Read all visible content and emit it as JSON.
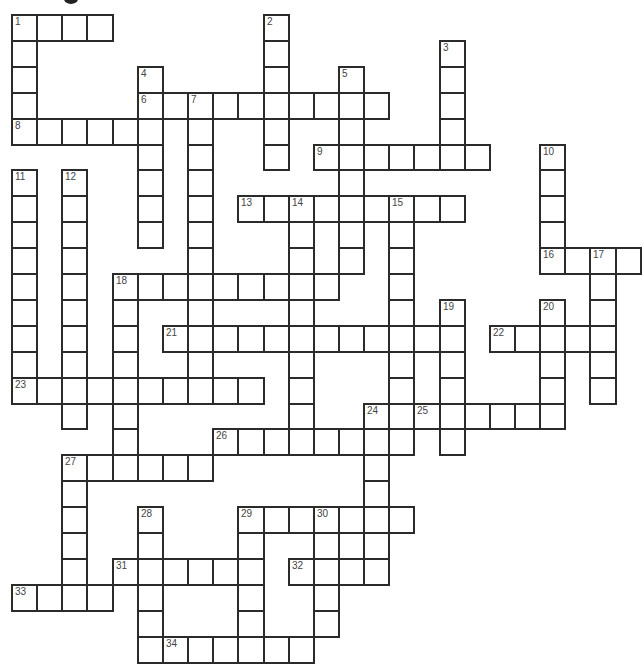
{
  "puzzle": {
    "type": "crossword",
    "title_fragment_visible": true,
    "grid": {
      "origin_x": 12,
      "origin_y": 15,
      "cell_width": 25.15,
      "cell_height": 25.9,
      "border_color": "#2b2b2b",
      "fill_color": "#ffffff",
      "number_color": "#444444"
    },
    "across": [
      {
        "num": "1",
        "row": 0,
        "col": 0,
        "len": 4
      },
      {
        "num": "6",
        "row": 3,
        "col": 5,
        "len": 10
      },
      {
        "num": "8",
        "row": 4,
        "col": 0,
        "len": 6
      },
      {
        "num": "9",
        "row": 5,
        "col": 12,
        "len": 7
      },
      {
        "num": "13",
        "row": 7,
        "col": 9,
        "len": 9
      },
      {
        "num": "16",
        "row": 9,
        "col": 21,
        "len": 4
      },
      {
        "num": "18",
        "row": 10,
        "col": 4,
        "len": 9
      },
      {
        "num": "21",
        "row": 12,
        "col": 6,
        "len": 12
      },
      {
        "num": "22",
        "row": 12,
        "col": 19,
        "len": 5
      },
      {
        "num": "23",
        "row": 14,
        "col": 0,
        "len": 10
      },
      {
        "num": "25",
        "row": 15,
        "col": 16,
        "len": 6
      },
      {
        "num": "26",
        "row": 16,
        "col": 8,
        "len": 8
      },
      {
        "num": "27",
        "row": 17,
        "col": 2,
        "len": 6
      },
      {
        "num": "29",
        "row": 19,
        "col": 9,
        "len": 7
      },
      {
        "num": "31",
        "row": 21,
        "col": 4,
        "len": 6
      },
      {
        "num": "32",
        "row": 21,
        "col": 11,
        "len": 4
      },
      {
        "num": "33",
        "row": 22,
        "col": 0,
        "len": 4
      },
      {
        "num": "34",
        "row": 24,
        "col": 6,
        "len": 6
      }
    ],
    "down": [
      {
        "num": "1",
        "row": 0,
        "col": 0,
        "len": 5
      },
      {
        "num": "2",
        "row": 0,
        "col": 10,
        "len": 6
      },
      {
        "num": "3",
        "row": 1,
        "col": 17,
        "len": 5
      },
      {
        "num": "4",
        "row": 2,
        "col": 5,
        "len": 7
      },
      {
        "num": "5",
        "row": 2,
        "col": 13,
        "len": 8
      },
      {
        "num": "7",
        "row": 3,
        "col": 7,
        "len": 12
      },
      {
        "num": "10",
        "row": 5,
        "col": 21,
        "len": 5
      },
      {
        "num": "11",
        "row": 6,
        "col": 0,
        "len": 9
      },
      {
        "num": "12",
        "row": 6,
        "col": 2,
        "len": 10
      },
      {
        "num": "14",
        "row": 7,
        "col": 11,
        "len": 10
      },
      {
        "num": "15",
        "row": 7,
        "col": 15,
        "len": 10
      },
      {
        "num": "17",
        "row": 9,
        "col": 23,
        "len": 6
      },
      {
        "num": "18",
        "row": 10,
        "col": 4,
        "len": 7
      },
      {
        "num": "19",
        "row": 11,
        "col": 17,
        "len": 6
      },
      {
        "num": "20",
        "row": 11,
        "col": 21,
        "len": 5
      },
      {
        "num": "24",
        "row": 15,
        "col": 14,
        "len": 7
      },
      {
        "num": "27",
        "row": 17,
        "col": 2,
        "len": 6
      },
      {
        "num": "28",
        "row": 19,
        "col": 5,
        "len": 6
      },
      {
        "num": "29",
        "row": 19,
        "col": 9,
        "len": 6
      },
      {
        "num": "30",
        "row": 19,
        "col": 12,
        "len": 5
      }
    ],
    "extra_cells": [
      {
        "row": 20,
        "col": 13
      }
    ]
  }
}
